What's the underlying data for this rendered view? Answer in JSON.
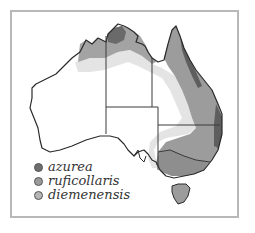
{
  "map": {
    "region": "Australia",
    "colors": {
      "azurea": "#6e6e6e",
      "ruficollaris": "#9a9a9a",
      "diemenensis": "#b5b5b5",
      "outer_range": "#e2e2e2",
      "border": "#2a2a2a"
    }
  },
  "legend": {
    "items": [
      {
        "label": "azurea",
        "color": "#6e6e6e"
      },
      {
        "label": "ruficollaris",
        "color": "#9a9a9a"
      },
      {
        "label": "diemenensis",
        "color": "#b5b5b5"
      }
    ]
  }
}
